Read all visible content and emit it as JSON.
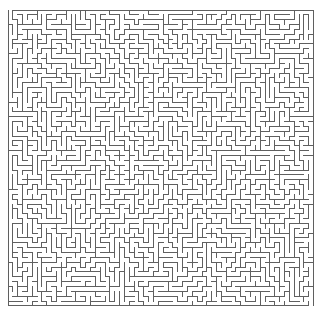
{
  "figure": {
    "kind": "maze",
    "caption": "",
    "canvas": {
      "width": 323,
      "height": 316,
      "background": "#ffffff"
    }
  },
  "maze": {
    "type": "perfect-maze",
    "algorithm": "randomized-depth-first-search",
    "seed": 20240517,
    "cols": 63,
    "rows": 61,
    "cell_size": 4.85,
    "origin_x": 8,
    "origin_y": 10,
    "width_px": 305,
    "height_px": 295,
    "wall_color": "#5a5a5a",
    "wall_thickness": 1,
    "passage_color": "#ffffff",
    "border": true,
    "entrance": {
      "label": "entrance",
      "side": "top",
      "col": 0,
      "row": 0
    },
    "exit": {
      "label": "exit",
      "side": "bottom",
      "col": 62,
      "row": 60
    }
  }
}
